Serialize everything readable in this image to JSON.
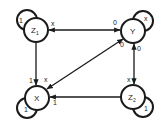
{
  "diagram": {
    "type": "state-diagram",
    "stroke_color": "#1a1a1a",
    "nodes": [
      {
        "id": "Z1",
        "label": "Z",
        "sub": "1",
        "cx": 36,
        "cy": 30
      },
      {
        "id": "Y",
        "label": "Y",
        "sub": "",
        "cx": 133,
        "cy": 31
      },
      {
        "id": "X",
        "label": "X",
        "sub": "",
        "cx": 37,
        "cy": 98
      },
      {
        "id": "Z2",
        "label": "Z",
        "sub": "2",
        "cx": 133,
        "cy": 97
      }
    ],
    "self_loops": [
      {
        "node": "Z1",
        "label": "1"
      },
      {
        "node": "Y",
        "label": "x"
      },
      {
        "node": "X",
        "label": "1"
      },
      {
        "node": "Z2",
        "label": "1"
      }
    ],
    "edges": [
      {
        "from": "Y",
        "to": "Z1",
        "label": "x"
      },
      {
        "from": "Z1",
        "to": "Y",
        "label": "0"
      },
      {
        "from": "Z1",
        "to": "X",
        "label": "1"
      },
      {
        "from": "Y",
        "to": "X",
        "label": "x"
      },
      {
        "from": "X",
        "to": "Y",
        "label": "0"
      },
      {
        "from": "Z2",
        "to": "Y",
        "label": "0"
      },
      {
        "from": "Y",
        "to": "Z2",
        "label": "x"
      },
      {
        "from": "Z2",
        "to": "X",
        "label": "1"
      }
    ]
  }
}
